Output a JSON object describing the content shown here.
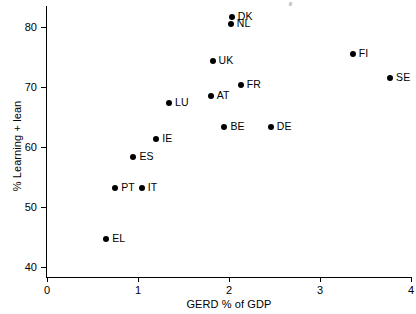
{
  "chart_data": {
    "type": "scatter",
    "title": "",
    "xlabel": "GERD % of GDP",
    "ylabel": "% Learning + lean",
    "xlim": [
      0,
      4
    ],
    "ylim": [
      40,
      83
    ],
    "xticks": [
      0,
      1,
      2,
      3,
      4
    ],
    "yticks": [
      40,
      50,
      60,
      70,
      80
    ],
    "xtick_labels": [
      "0",
      "1",
      "2",
      "3",
      "4"
    ],
    "ytick_labels": [
      "40",
      "50",
      "60",
      "70",
      "80"
    ],
    "grid": false,
    "legend": "none",
    "marker": "filled-circle",
    "marker_color": "#000000",
    "points": [
      {
        "label": "DK",
        "x": 2.03,
        "y": 81.7,
        "label_pos": "right"
      },
      {
        "label": "NL",
        "x": 2.02,
        "y": 80.5,
        "label_pos": "right"
      },
      {
        "label": "FI",
        "x": 3.36,
        "y": 75.5,
        "label_pos": "right"
      },
      {
        "label": "UK",
        "x": 1.82,
        "y": 74.3,
        "label_pos": "right"
      },
      {
        "label": "SE",
        "x": 3.77,
        "y": 71.5,
        "label_pos": "right"
      },
      {
        "label": "FR",
        "x": 2.13,
        "y": 70.3,
        "label_pos": "right"
      },
      {
        "label": "AT",
        "x": 1.8,
        "y": 68.5,
        "label_pos": "right"
      },
      {
        "label": "LU",
        "x": 1.34,
        "y": 67.3,
        "label_pos": "right"
      },
      {
        "label": "BE",
        "x": 1.95,
        "y": 63.3,
        "label_pos": "right"
      },
      {
        "label": "DE",
        "x": 2.46,
        "y": 63.3,
        "label_pos": "right"
      },
      {
        "label": "IE",
        "x": 1.2,
        "y": 61.3,
        "label_pos": "right"
      },
      {
        "label": "ES",
        "x": 0.95,
        "y": 58.3,
        "label_pos": "right"
      },
      {
        "label": "PT",
        "x": 0.75,
        "y": 53.2,
        "label_pos": "right"
      },
      {
        "label": "IT",
        "x": 1.04,
        "y": 53.2,
        "label_pos": "right"
      },
      {
        "label": "EL",
        "x": 0.65,
        "y": 44.7,
        "label_pos": "right"
      }
    ]
  }
}
